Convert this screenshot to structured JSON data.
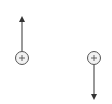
{
  "diagram": {
    "nodes": [
      {
        "id": "left-node",
        "symbol": "⊕",
        "x": 22,
        "y": 58,
        "r": 6.5,
        "arrow_direction": "up",
        "arrow_end_y": 16
      },
      {
        "id": "right-node",
        "symbol": "⊕",
        "x": 94,
        "y": 58,
        "r": 6.5,
        "arrow_direction": "down",
        "arrow_end_y": 101
      }
    ],
    "colors": {
      "stroke": "#555555",
      "fill": "#f2f2f2",
      "background": "#ffffff"
    }
  }
}
